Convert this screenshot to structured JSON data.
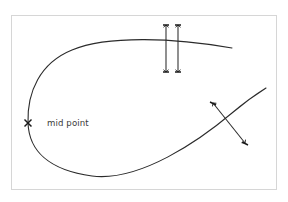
{
  "canvas": {
    "width": 288,
    "height": 202,
    "background_color": "#ffffff",
    "frame": {
      "x": 11,
      "y": 15,
      "width": 266,
      "height": 175,
      "border_color": "#d6d6d6"
    }
  },
  "diagram": {
    "title": "",
    "stroke_color": "#2b2b2b",
    "labels": [
      {
        "name": "mid-point-label",
        "text": "mid point",
        "x": 47,
        "y": 118
      }
    ],
    "markers": [
      {
        "name": "mid-point-marker",
        "symbol": "x-marker",
        "x": 28,
        "y": 123,
        "size": 5
      }
    ],
    "curve": {
      "name": "teardrop-loop-curve",
      "path": "M 28 123 C 27 92 40 63 72 50 C 108 35 175 38 232 48 M 28 123 C 29 150 48 170 92 176 C 140 182 200 140 232 113 C 245 102 258 93 266 88",
      "description": "teardrop loop curve"
    },
    "dimension_arrows": [
      {
        "name": "vertical-arrow-left",
        "orientation": "vertical",
        "x1": 166,
        "y1": 25,
        "x2": 166,
        "y2": 72,
        "double_headed": true
      },
      {
        "name": "vertical-arrow-right",
        "orientation": "vertical",
        "x1": 178,
        "y1": 25,
        "x2": 178,
        "y2": 72,
        "double_headed": true
      },
      {
        "name": "diagonal-arrow",
        "orientation": "diagonal",
        "x1": 213,
        "y1": 103,
        "x2": 245,
        "y2": 143,
        "double_headed": true
      }
    ]
  }
}
